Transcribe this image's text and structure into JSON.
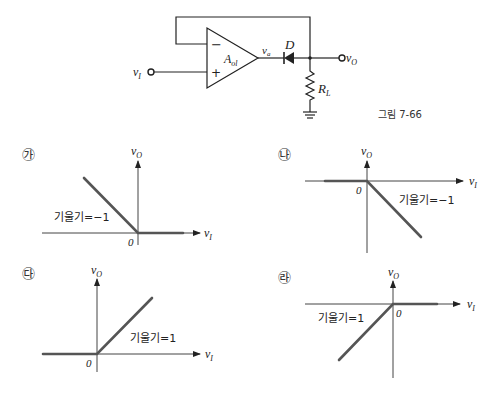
{
  "figure_caption": "그림 7-66",
  "circuit": {
    "input_label": "v",
    "input_sub": "I",
    "opamp_label": "A",
    "opamp_sub": "ol",
    "minus_sign": "−",
    "plus_sign": "+",
    "opamp_output_label": "v",
    "opamp_output_sub": "a",
    "diode_label": "D",
    "resistor_label": "R",
    "resistor_sub": "L",
    "output_label": "v",
    "output_sub": "O"
  },
  "graphs": [
    {
      "id": "ga",
      "marker": "㉮",
      "x_label": "v",
      "x_sub": "I",
      "y_label": "v",
      "y_sub": "O",
      "origin_label": "0",
      "slope_label": "기울기=−1"
    },
    {
      "id": "na",
      "marker": "㉯",
      "x_label": "v",
      "x_sub": "I",
      "y_label": "v",
      "y_sub": "O",
      "origin_label": "0",
      "slope_label": "기울기=−1"
    },
    {
      "id": "da",
      "marker": "㉰",
      "x_label": "v",
      "x_sub": "I",
      "y_label": "v",
      "y_sub": "O",
      "origin_label": "0",
      "slope_label": "기울기=1"
    },
    {
      "id": "ra",
      "marker": "㉱",
      "x_label": "v",
      "x_sub": "I",
      "y_label": "v",
      "y_sub": "O",
      "origin_label": "0",
      "slope_label": "기울기=1"
    }
  ]
}
